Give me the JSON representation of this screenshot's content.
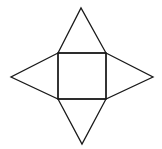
{
  "diagram": {
    "background": "#ffffff",
    "stroke_color": "#1a1a1a",
    "square": {
      "x": 58,
      "y": 53,
      "width": 48,
      "height": 46
    },
    "triangles": [
      {
        "name": "top-face",
        "points": [
          [
            58,
            53
          ],
          [
            81,
            8
          ],
          [
            106,
            53
          ]
        ]
      },
      {
        "name": "left-face",
        "points": [
          [
            58,
            53
          ],
          [
            11,
            77
          ],
          [
            58,
            99
          ]
        ]
      },
      {
        "name": "right-face",
        "points": [
          [
            106,
            53
          ],
          [
            153,
            77
          ],
          [
            106,
            99
          ]
        ]
      },
      {
        "name": "bottom-face",
        "points": [
          [
            58,
            99
          ],
          [
            82,
            144
          ],
          [
            106,
            99
          ]
        ]
      }
    ]
  }
}
